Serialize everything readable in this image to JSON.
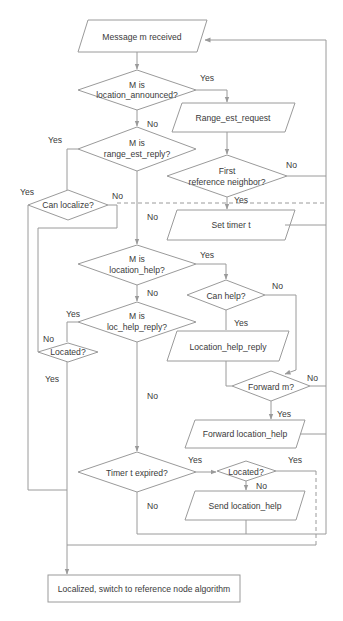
{
  "diagram": {
    "type": "flowchart",
    "stroke_color": "#9a9a9a",
    "text_color": "#3a3a3a",
    "background": "#ffffff",
    "nodes": {
      "message_received": {
        "shape": "parallelogram",
        "label": "Message m received"
      },
      "is_location_announced": {
        "shape": "diamond",
        "line1": "M is",
        "line2": "location_announced?"
      },
      "range_est_request": {
        "shape": "parallelogram",
        "label": "Range_est_request"
      },
      "first_reference_neighbor": {
        "shape": "diamond",
        "line1": "First",
        "line2": "reference neighbor?"
      },
      "is_range_est_reply": {
        "shape": "diamond",
        "line1": "M is",
        "line2": "range_est_reply?"
      },
      "can_localize": {
        "shape": "diamond",
        "label": "Can localize?"
      },
      "set_timer": {
        "shape": "parallelogram",
        "label": "Set timer  t"
      },
      "is_location_help": {
        "shape": "diamond",
        "line1": "M is",
        "line2": "location_help?"
      },
      "can_help": {
        "shape": "diamond",
        "label": "Can help?"
      },
      "is_loc_help_reply": {
        "shape": "diamond",
        "line1": "M is",
        "line2": "loc_help_reply?"
      },
      "located_left": {
        "shape": "diamond",
        "label": "Located?"
      },
      "location_help_reply": {
        "shape": "parallelogram",
        "label": "Location_help_reply"
      },
      "forward_m": {
        "shape": "diamond",
        "label": "Forward m?"
      },
      "forward_location_help": {
        "shape": "parallelogram",
        "label": "Forward location_help"
      },
      "timer_expired": {
        "shape": "diamond",
        "label": "Timer t expired?"
      },
      "located_right": {
        "shape": "diamond",
        "label": "Located?"
      },
      "send_location_help": {
        "shape": "parallelogram",
        "label": "Send location_help"
      },
      "localized_switch": {
        "shape": "rectangle",
        "label": "Localized, switch to reference node algorithm"
      }
    },
    "edge_labels": {
      "loc_announced_yes": "Yes",
      "loc_announced_no": "No",
      "range_reply_yes": "Yes",
      "range_reply_no": "No",
      "first_ref_no": "No",
      "first_ref_yes": "Yes",
      "can_localize_yes": "Yes",
      "can_localize_no": "No",
      "location_help_yes": "Yes",
      "location_help_no": "No",
      "can_help_no": "No",
      "can_help_yes": "Yes",
      "loc_help_reply_yes": "Yes",
      "loc_help_reply_no": "No",
      "located_left_no": "No",
      "located_left_yes": "Yes",
      "forward_m_no": "No",
      "forward_m_yes": "Yes",
      "timer_yes": "Yes",
      "timer_no": "No",
      "located_right_yes": "Yes",
      "located_right_no": "No"
    }
  }
}
